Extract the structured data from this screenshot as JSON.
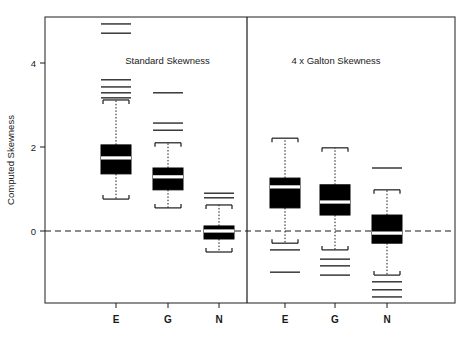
{
  "figure": {
    "ylabel": "Computed Skewness",
    "background": "#ffffff",
    "frame_color": "#333333",
    "box_fill": "#000000",
    "median_color": "#ffffff",
    "reference_line_value": 0
  },
  "chart_data": {
    "type": "box",
    "title": "",
    "xlabel": "",
    "ylabel": "Computed Skewness",
    "ylim": [
      -1.6,
      5.1
    ],
    "yticks": [
      0,
      2,
      4
    ],
    "ytick_labels": [
      "0",
      "2",
      "4"
    ],
    "grid": false,
    "legend": null,
    "reference_lines": [
      {
        "y": 0,
        "style": "dashed"
      }
    ],
    "panels": [
      {
        "label": "Standard Skewness",
        "categories": [
          "E",
          "G",
          "N"
        ],
        "boxes": [
          {
            "category": "E",
            "whisker_low": 0.76,
            "q1": 1.36,
            "median": 1.74,
            "q3": 2.05,
            "whisker_high": 3.12,
            "outliers": [
              3.17,
              3.29,
              3.43,
              3.6,
              4.71,
              4.93
            ]
          },
          {
            "category": "G",
            "whisker_low": 0.55,
            "q1": 0.98,
            "median": 1.29,
            "q3": 1.5,
            "whisker_high": 2.1,
            "outliers": [
              2.4,
              2.57,
              3.29
            ]
          },
          {
            "category": "N",
            "whisker_low": -0.5,
            "q1": -0.19,
            "median": 0.0,
            "q3": 0.12,
            "whisker_high": 0.62,
            "outliers": [
              0.79,
              0.9
            ]
          }
        ]
      },
      {
        "label": "4 x Galton Skewness",
        "categories": [
          "E",
          "G",
          "N"
        ],
        "boxes": [
          {
            "category": "E",
            "whisker_low": -0.29,
            "q1": 0.55,
            "median": 1.05,
            "q3": 1.26,
            "whisker_high": 2.21,
            "outliers": [
              -0.45,
              -0.98
            ]
          },
          {
            "category": "G",
            "whisker_low": -0.45,
            "q1": 0.38,
            "median": 0.69,
            "q3": 1.1,
            "whisker_high": 1.98,
            "outliers": [
              -0.67,
              -0.83,
              -1.05
            ]
          },
          {
            "category": "N",
            "whisker_low": -1.05,
            "q1": -0.29,
            "median": -0.05,
            "q3": 0.38,
            "whisker_high": 0.98,
            "outliers": [
              1.5,
              -1.21,
              -1.4,
              -1.57
            ]
          }
        ]
      }
    ]
  }
}
